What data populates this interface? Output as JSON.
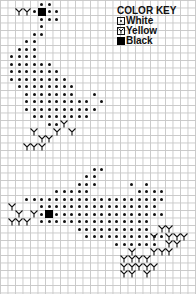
{
  "key": {
    "title": "COLOR KEY",
    "items": [
      {
        "symbol": "dot",
        "label": "White"
      },
      {
        "symbol": "y",
        "label": "Yellow"
      },
      {
        "symbol": "square",
        "label": "Black"
      }
    ]
  },
  "grid": {
    "pitch": 7.5,
    "cols": 26,
    "rows": 39
  },
  "patterns": [
    {
      "name": "top-bird",
      "white": [
        [
          5,
          0
        ],
        [
          6,
          0
        ],
        [
          4,
          1
        ],
        [
          6,
          1
        ],
        [
          7,
          1
        ],
        [
          5,
          2
        ],
        [
          6,
          2
        ],
        [
          7,
          2
        ],
        [
          5,
          3
        ],
        [
          5,
          4
        ],
        [
          4,
          4
        ],
        [
          3,
          5
        ],
        [
          4,
          5
        ],
        [
          2,
          6
        ],
        [
          3,
          6
        ],
        [
          4,
          6
        ],
        [
          1,
          7
        ],
        [
          2,
          7
        ],
        [
          3,
          7
        ],
        [
          4,
          7
        ],
        [
          1,
          8
        ],
        [
          2,
          8
        ],
        [
          3,
          8
        ],
        [
          4,
          8
        ],
        [
          5,
          8
        ],
        [
          6,
          8
        ],
        [
          1,
          9
        ],
        [
          2,
          9
        ],
        [
          3,
          9
        ],
        [
          4,
          9
        ],
        [
          5,
          9
        ],
        [
          6,
          9
        ],
        [
          7,
          9
        ],
        [
          1,
          10
        ],
        [
          2,
          10
        ],
        [
          3,
          10
        ],
        [
          4,
          10
        ],
        [
          5,
          10
        ],
        [
          6,
          10
        ],
        [
          7,
          10
        ],
        [
          8,
          10
        ],
        [
          2,
          11
        ],
        [
          3,
          11
        ],
        [
          4,
          11
        ],
        [
          5,
          11
        ],
        [
          6,
          11
        ],
        [
          7,
          11
        ],
        [
          8,
          11
        ],
        [
          9,
          11
        ],
        [
          3,
          12
        ],
        [
          4,
          12
        ],
        [
          5,
          12
        ],
        [
          6,
          12
        ],
        [
          7,
          12
        ],
        [
          8,
          12
        ],
        [
          9,
          12
        ],
        [
          12,
          12
        ],
        [
          3,
          13
        ],
        [
          4,
          13
        ],
        [
          5,
          13
        ],
        [
          6,
          13
        ],
        [
          7,
          13
        ],
        [
          8,
          13
        ],
        [
          9,
          13
        ],
        [
          10,
          13
        ],
        [
          11,
          13
        ],
        [
          13,
          13
        ],
        [
          3,
          14
        ],
        [
          4,
          14
        ],
        [
          5,
          14
        ],
        [
          6,
          14
        ],
        [
          7,
          14
        ],
        [
          8,
          14
        ],
        [
          9,
          14
        ],
        [
          10,
          14
        ],
        [
          11,
          14
        ],
        [
          12,
          14
        ],
        [
          4,
          15
        ],
        [
          5,
          15
        ],
        [
          6,
          15
        ],
        [
          7,
          15
        ],
        [
          8,
          15
        ],
        [
          9,
          15
        ],
        [
          10,
          15
        ],
        [
          11,
          15
        ],
        [
          6,
          16
        ],
        [
          7,
          16
        ]
      ],
      "black": [
        [
          5,
          1
        ]
      ],
      "yellow": [
        [
          2,
          1
        ],
        [
          3,
          1
        ],
        [
          4,
          17
        ],
        [
          5,
          18
        ],
        [
          3,
          19
        ],
        [
          4,
          19
        ],
        [
          5,
          19
        ],
        [
          6,
          18
        ],
        [
          7,
          17
        ],
        [
          8,
          16
        ],
        [
          9,
          17
        ]
      ]
    },
    {
      "name": "bottom-bird",
      "white": [
        [
          12,
          22
        ],
        [
          13,
          22
        ],
        [
          11,
          23
        ],
        [
          12,
          23
        ],
        [
          10,
          24
        ],
        [
          11,
          24
        ],
        [
          12,
          24
        ],
        [
          10,
          25
        ],
        [
          11,
          25
        ],
        [
          17,
          24
        ],
        [
          19,
          24
        ],
        [
          7,
          25
        ],
        [
          8,
          25
        ],
        [
          9,
          25
        ],
        [
          20,
          25
        ],
        [
          21,
          25
        ],
        [
          18,
          25
        ],
        [
          19,
          25
        ],
        [
          3,
          26
        ],
        [
          4,
          26
        ],
        [
          5,
          26
        ],
        [
          6,
          26
        ],
        [
          7,
          26
        ],
        [
          8,
          26
        ],
        [
          9,
          26
        ],
        [
          10,
          26
        ],
        [
          11,
          26
        ],
        [
          12,
          26
        ],
        [
          13,
          26
        ],
        [
          14,
          26
        ],
        [
          15,
          26
        ],
        [
          16,
          26
        ],
        [
          17,
          26
        ],
        [
          18,
          26
        ],
        [
          19,
          26
        ],
        [
          20,
          26
        ],
        [
          21,
          26
        ],
        [
          5,
          27
        ],
        [
          6,
          27
        ],
        [
          7,
          27
        ],
        [
          8,
          27
        ],
        [
          9,
          27
        ],
        [
          10,
          27
        ],
        [
          11,
          27
        ],
        [
          12,
          27
        ],
        [
          13,
          27
        ],
        [
          14,
          27
        ],
        [
          15,
          27
        ],
        [
          16,
          27
        ],
        [
          17,
          27
        ],
        [
          18,
          27
        ],
        [
          19,
          27
        ],
        [
          20,
          27
        ],
        [
          5,
          28
        ],
        [
          7,
          28
        ],
        [
          8,
          28
        ],
        [
          9,
          28
        ],
        [
          10,
          28
        ],
        [
          11,
          28
        ],
        [
          12,
          28
        ],
        [
          13,
          28
        ],
        [
          14,
          28
        ],
        [
          15,
          28
        ],
        [
          16,
          28
        ],
        [
          17,
          28
        ],
        [
          18,
          28
        ],
        [
          19,
          28
        ],
        [
          20,
          28
        ],
        [
          21,
          28
        ],
        [
          5,
          29
        ],
        [
          6,
          29
        ],
        [
          7,
          29
        ],
        [
          8,
          29
        ],
        [
          9,
          29
        ],
        [
          10,
          29
        ],
        [
          11,
          29
        ],
        [
          12,
          29
        ],
        [
          13,
          29
        ],
        [
          14,
          29
        ],
        [
          15,
          29
        ],
        [
          16,
          29
        ],
        [
          17,
          29
        ],
        [
          18,
          29
        ],
        [
          19,
          29
        ],
        [
          10,
          30
        ],
        [
          11,
          30
        ],
        [
          12,
          30
        ],
        [
          13,
          30
        ],
        [
          14,
          30
        ],
        [
          15,
          30
        ],
        [
          16,
          30
        ],
        [
          17,
          30
        ],
        [
          18,
          30
        ],
        [
          19,
          30
        ],
        [
          11,
          31
        ],
        [
          12,
          31
        ],
        [
          13,
          31
        ],
        [
          14,
          31
        ],
        [
          15,
          31
        ],
        [
          16,
          31
        ],
        [
          17,
          31
        ],
        [
          18,
          31
        ],
        [
          19,
          31
        ],
        [
          20,
          31
        ],
        [
          21,
          31
        ],
        [
          15,
          32
        ],
        [
          16,
          32
        ],
        [
          17,
          32
        ],
        [
          18,
          32
        ],
        [
          19,
          32
        ],
        [
          20,
          32
        ]
      ],
      "black": [
        [
          6,
          28
        ]
      ],
      "yellow": [
        [
          1,
          27
        ],
        [
          2,
          28
        ],
        [
          3,
          29
        ],
        [
          4,
          28
        ],
        [
          1,
          29
        ],
        [
          2,
          29
        ],
        [
          20,
          31
        ],
        [
          21,
          30
        ],
        [
          22,
          30
        ],
        [
          22,
          31
        ],
        [
          22,
          32
        ],
        [
          23,
          32
        ],
        [
          23,
          31
        ],
        [
          24,
          31
        ],
        [
          21,
          33
        ],
        [
          22,
          33
        ],
        [
          20,
          33
        ],
        [
          17,
          33
        ],
        [
          18,
          34
        ],
        [
          19,
          34
        ],
        [
          18,
          35
        ],
        [
          19,
          35
        ],
        [
          20,
          35
        ],
        [
          16,
          34
        ],
        [
          17,
          34
        ],
        [
          16,
          35
        ],
        [
          17,
          35
        ],
        [
          17,
          36
        ],
        [
          19,
          36
        ],
        [
          16,
          36
        ]
      ]
    }
  ]
}
